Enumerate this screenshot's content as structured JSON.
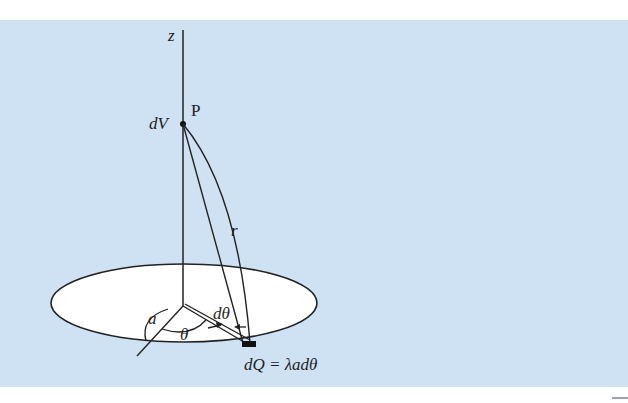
{
  "figure": {
    "background_color": "#cfe2f3",
    "disk_fill": "#ffffff",
    "stroke_color": "#222222",
    "labels": {
      "z_axis": "z",
      "point": "P",
      "potential_element": "dV",
      "distance": "r",
      "radius": "a",
      "angle": "θ",
      "angle_element": "dθ",
      "charge_element": "dQ = λadθ"
    }
  }
}
